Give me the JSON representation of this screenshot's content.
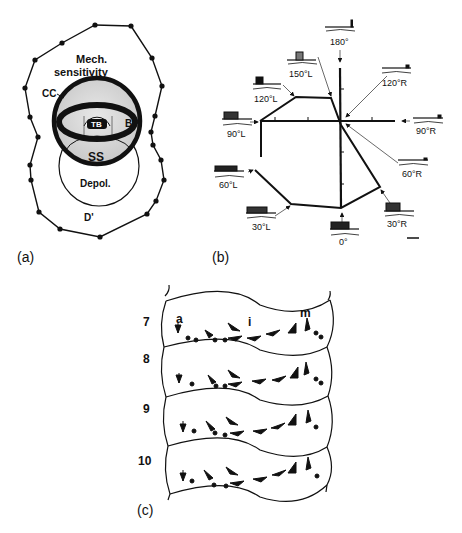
{
  "panels": {
    "a": {
      "label": "(a)",
      "title_line1": "Mech.",
      "title_line2": "sensitivity",
      "cc": "CC",
      "tb": "TB",
      "bp": "BP",
      "ss": "SS",
      "depol": "Depol.",
      "d": "D'"
    },
    "b": {
      "label": "(b)",
      "angles": [
        {
          "id": "180",
          "text": "180°"
        },
        {
          "id": "150L",
          "text": "150°L"
        },
        {
          "id": "120L",
          "text": "120°L"
        },
        {
          "id": "120R",
          "text": "120°R"
        },
        {
          "id": "90L",
          "text": "90°L"
        },
        {
          "id": "90R",
          "text": "90°R"
        },
        {
          "id": "60L",
          "text": "60°L"
        },
        {
          "id": "60R",
          "text": "60°R"
        },
        {
          "id": "30L",
          "text": "30°L"
        },
        {
          "id": "30R",
          "text": "30°R"
        },
        {
          "id": "0",
          "text": "0°"
        }
      ]
    },
    "c": {
      "label": "(c)",
      "segments": [
        "7",
        "8",
        "9",
        "10"
      ],
      "region_labels": {
        "a": "a",
        "i": "i",
        "m": "m"
      }
    }
  }
}
